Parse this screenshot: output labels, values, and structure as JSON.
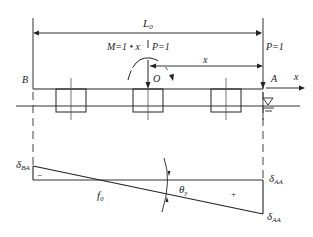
{
  "figure": {
    "type": "influence-line-diagram",
    "top": {
      "span_label": "L",
      "span_label_sub": "0",
      "moment_label": "M=1 • x",
      "load_center_label": "P=1",
      "load_right_label": "P=1",
      "distance_label": "x",
      "origin_label": "O",
      "left_end_label": "B",
      "right_end_label": "A",
      "axis_label": "x",
      "water_symbol": "water-level-triangle",
      "piles": 3
    },
    "bottom": {
      "left_value_label": "δ",
      "left_value_sub": "BA",
      "left_sign": "−",
      "zero_point_label": "f",
      "zero_point_sub": "0",
      "slope_label": "θ",
      "slope_sub": "y",
      "right_sign": "+",
      "right_top_label": "δ",
      "right_top_sub": "AA",
      "right_bottom_label": "δ",
      "right_bottom_sub": "AA"
    }
  }
}
